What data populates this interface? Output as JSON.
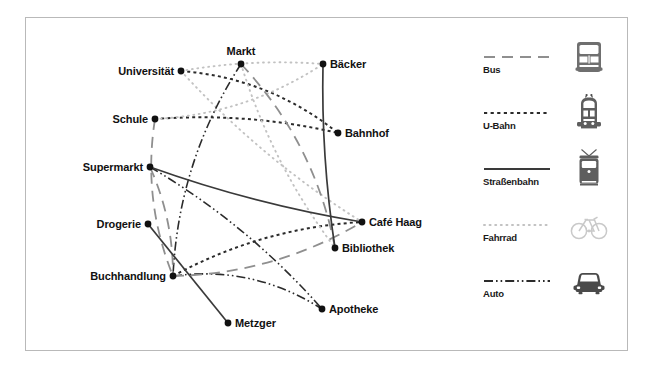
{
  "figure": {
    "type": "transport-network-map",
    "border_color": "#b9b9b9",
    "background": "#ffffff"
  },
  "map": {
    "nodes": [
      {
        "id": "universitaet",
        "label": "Universität",
        "x": 155,
        "y": 53,
        "label_side": "left"
      },
      {
        "id": "markt",
        "label": "Markt",
        "x": 215,
        "y": 46,
        "label_side": "above"
      },
      {
        "id": "baecker",
        "label": "Bäcker",
        "x": 297,
        "y": 46,
        "label_side": "right"
      },
      {
        "id": "schule",
        "label": "Schule",
        "x": 129,
        "y": 101,
        "label_side": "left"
      },
      {
        "id": "bahnhof",
        "label": "Bahnhof",
        "x": 312,
        "y": 115,
        "label_side": "right"
      },
      {
        "id": "supermarkt",
        "label": "Supermarkt",
        "x": 124,
        "y": 149,
        "label_side": "left"
      },
      {
        "id": "drogerie",
        "label": "Drogerie",
        "x": 122,
        "y": 206,
        "label_side": "left"
      },
      {
        "id": "cafe_haag",
        "label": "Café Haag",
        "x": 336,
        "y": 204,
        "label_side": "right"
      },
      {
        "id": "bibliothek",
        "label": "Bibliothek",
        "x": 309,
        "y": 230,
        "label_side": "right"
      },
      {
        "id": "buchhandlung",
        "label": "Buchhandlung",
        "x": 147,
        "y": 258,
        "label_side": "left"
      },
      {
        "id": "apotheke",
        "label": "Apotheke",
        "x": 296,
        "y": 291,
        "label_side": "right"
      },
      {
        "id": "metzger",
        "label": "Metzger",
        "x": 202,
        "y": 305,
        "label_side": "right"
      }
    ],
    "edges": [
      {
        "from": "universitaet",
        "to": "bahnhof",
        "mode": "u-bahn",
        "curve": -26
      },
      {
        "from": "schule",
        "to": "bahnhof",
        "mode": "u-bahn",
        "curve": -14
      },
      {
        "from": "buchhandlung",
        "to": "cafe_haag",
        "mode": "u-bahn",
        "curve": -22
      },
      {
        "from": "universitaet",
        "to": "baecker",
        "mode": "fahrrad",
        "curve": -9
      },
      {
        "from": "universitaet",
        "to": "cafe_haag",
        "mode": "fahrrad",
        "curve": 16
      },
      {
        "from": "schule",
        "to": "baecker",
        "mode": "fahrrad",
        "curve": 24
      },
      {
        "from": "markt",
        "to": "bibliothek",
        "mode": "fahrrad",
        "curve": 18
      },
      {
        "from": "markt",
        "to": "buchhandlung",
        "mode": "auto",
        "curve": 30
      },
      {
        "from": "buchhandlung",
        "to": "apotheke",
        "mode": "auto",
        "curve": -28
      },
      {
        "from": "supermarkt",
        "to": "apotheke",
        "mode": "auto",
        "curve": -18
      },
      {
        "from": "markt",
        "to": "bibliothek",
        "mode": "bus",
        "curve": -30
      },
      {
        "from": "schule",
        "to": "buchhandlung",
        "mode": "bus",
        "curve": 22
      },
      {
        "from": "supermarkt",
        "to": "buchhandlung",
        "mode": "bus",
        "curve": -12
      },
      {
        "from": "buchhandlung",
        "to": "cafe_haag",
        "mode": "bus",
        "curve": 26
      },
      {
        "from": "supermarkt",
        "to": "cafe_haag",
        "mode": "strassenbahn",
        "curve": 10
      },
      {
        "from": "baecker",
        "to": "bibliothek",
        "mode": "strassenbahn",
        "curve": 8
      },
      {
        "from": "drogerie",
        "to": "metzger",
        "mode": "strassenbahn",
        "curve": 0
      }
    ]
  },
  "legend": {
    "title": "",
    "items": [
      {
        "id": "bus",
        "label": "Bus",
        "icon": "bus-icon",
        "color": "#8f8f8f",
        "style": "long-dash"
      },
      {
        "id": "u-bahn",
        "label": "U-Bahn",
        "icon": "subway-train-icon",
        "color": "#2b2b2b",
        "style": "short-dash"
      },
      {
        "id": "strassenbahn",
        "label": "Straßenbahn",
        "icon": "tram-icon",
        "color": "#3a3a3a",
        "style": "solid"
      },
      {
        "id": "fahrrad",
        "label": "Fahrrad",
        "icon": "bicycle-icon",
        "color": "#c2c2c2",
        "style": "dotted"
      },
      {
        "id": "auto",
        "label": "Auto",
        "icon": "car-icon",
        "color": "#2b2b2b",
        "style": "dash-dot-dot"
      }
    ]
  }
}
